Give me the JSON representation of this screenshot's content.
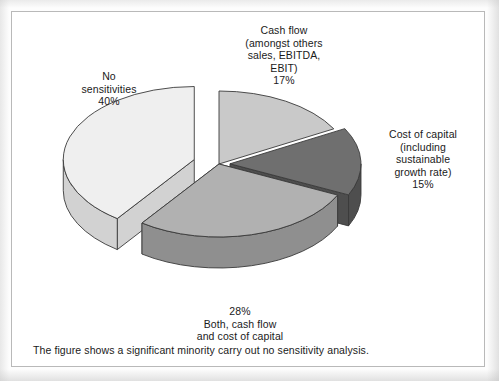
{
  "figure": {
    "caption": "The figure shows a significant minority carry out no sensitivity analysis."
  },
  "labels": {
    "cash_flow": "Cash flow\n(amongst others\nsales, EBITDA,\nEBIT)\n17%",
    "cost_of_capital": "Cost of capital\n(including\nsustainable\ngrowth rate)\n15%",
    "no_sensitivities": "No\nsensitivities\n40%",
    "both": "28%\nBoth, cash flow\nand cost of capital"
  },
  "chart_data": {
    "type": "pie",
    "title": "",
    "subtitle": "",
    "xlabel": "",
    "ylabel": "",
    "legend_position": "none",
    "grid": false,
    "three_d": true,
    "start_angle_deg": 0,
    "direction": "clockwise",
    "categories": [
      "Cash flow (amongst others sales, EBITDA, EBIT)",
      "Cost of capital (including sustainable growth rate)",
      "Both, cash flow and cost of capital",
      "No sensitivities"
    ],
    "values": [
      17,
      15,
      28,
      40
    ],
    "unit": "%",
    "total": 100,
    "slices": [
      {
        "name": "Cash flow (amongst others sales, EBITDA, EBIT)",
        "short_name": "Cash flow",
        "value": 17,
        "label": "17%",
        "color": "#c9c9c9",
        "side_color": "#a8a8a8",
        "exploded": false
      },
      {
        "name": "Cost of capital (including sustainable growth rate)",
        "short_name": "Cost of capital",
        "value": 15,
        "label": "15%",
        "color": "#6f6f6f",
        "side_color": "#4e4e4e",
        "exploded": true
      },
      {
        "name": "Both, cash flow and cost of capital",
        "short_name": "Both",
        "value": 28,
        "label": "28%",
        "color": "#b1b1b1",
        "side_color": "#8f8f8f",
        "exploded": false
      },
      {
        "name": "No sensitivities",
        "short_name": "No sensitivities",
        "value": 40,
        "label": "40%",
        "color": "#efefef",
        "side_color": "#d2d2d2",
        "exploded": true
      }
    ],
    "annotations": [
      "The figure shows a significant minority carry out no sensitivity analysis."
    ]
  },
  "colors": {
    "page_background": "#fdfdfd",
    "frame_border": "#b9b9b9",
    "text": "#1a1a1a",
    "outline": "#3a3a3a"
  }
}
